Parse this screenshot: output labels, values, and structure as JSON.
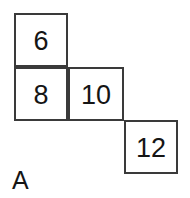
{
  "figure": {
    "caption": "A",
    "shape_description": "staircase-of-squares",
    "stroke_color": "#3a3a3a",
    "text_color": "#151515",
    "background_color": "#ffffff",
    "cells": [
      {
        "label": "6",
        "row": 0,
        "col": 0
      },
      {
        "label": "8",
        "row": 1,
        "col": 0
      },
      {
        "label": "10",
        "row": 1,
        "col": 1
      },
      {
        "label": "12",
        "row": 2,
        "col": 2
      }
    ]
  },
  "chart_data": {
    "type": "table",
    "title": "A",
    "xlabel": "",
    "ylabel": "",
    "categories": [
      "6",
      "8",
      "10",
      "12"
    ],
    "values": [
      6,
      8,
      10,
      12
    ],
    "grid": false,
    "annotations": [
      "Four unit squares arranged in a descending staircase pattern",
      "Square labeled 6 sits on top of square labeled 8",
      "Square labeled 10 sits to the right of square labeled 8",
      "Square labeled 12 sits below-right of square labeled 10",
      "Figure caption label: A"
    ]
  }
}
